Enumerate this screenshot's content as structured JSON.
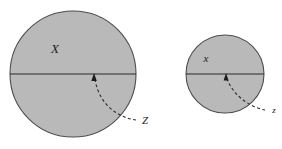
{
  "figure": {
    "background_color": "#ffffff",
    "stroke_color": "#2b2b2b",
    "outline_color": "#4d4d4d",
    "fill_color": "#b9b9b9",
    "label_color": "#1c1c1c"
  },
  "panels": [
    {
      "id": "large-disk-panel",
      "disk": {
        "name": "large-disk",
        "cx": 73,
        "cy": 74,
        "r": 63,
        "fill": "#b9b9b9",
        "outline": "#4d4d4d"
      },
      "chord": {
        "name": "large-disk-chord",
        "x1": 10,
        "y1": 74,
        "x2": 136,
        "y2": 74
      },
      "set_label": {
        "name": "large-disk-set-label",
        "text": "X",
        "x": 55,
        "y": 53,
        "size": "big"
      },
      "leader_label": {
        "name": "large-disk-leader-label",
        "text": "Z",
        "x": 145,
        "y": 124,
        "size": "small"
      },
      "leader": {
        "name": "large-disk-leader-curve",
        "path": "M 136 120 C 120 118, 99 106, 95 79",
        "arrow_tip_x": 94,
        "arrow_tip_y": 73,
        "arrow_base_left_x": 91.4,
        "arrow_base_left_y": 81,
        "arrow_base_right_x": 96.8,
        "arrow_base_right_y": 81
      }
    },
    {
      "id": "small-disk-panel",
      "disk": {
        "name": "small-disk",
        "cx": 225,
        "cy": 74,
        "r": 39,
        "fill": "#b9b9b9",
        "outline": "#4d4d4d"
      },
      "chord": {
        "name": "small-disk-chord",
        "x1": 186,
        "y1": 74,
        "x2": 264,
        "y2": 74
      },
      "set_label": {
        "name": "small-disk-set-label",
        "text": "x",
        "x": 206,
        "y": 62,
        "size": "small"
      },
      "leader_label": {
        "name": "small-disk-leader-label",
        "text": "z",
        "x": 274,
        "y": 113,
        "size": "tiny"
      },
      "leader": {
        "name": "small-disk-leader-curve",
        "path": "M 265 110 C 254 108, 235 99, 227 79",
        "arrow_tip_x": 226,
        "arrow_tip_y": 73,
        "arrow_base_left_x": 223.6,
        "arrow_base_left_y": 80.5,
        "arrow_base_right_x": 228.6,
        "arrow_base_right_y": 80.5
      }
    }
  ]
}
